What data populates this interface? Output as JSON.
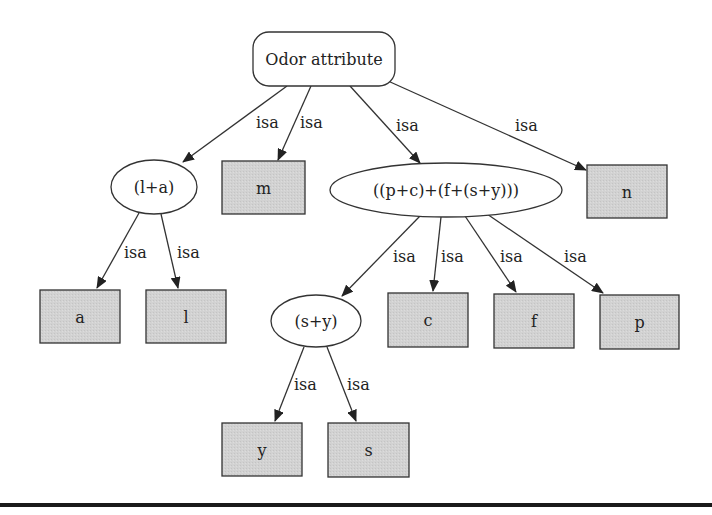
{
  "diagram": {
    "type": "tree",
    "colors": {
      "leaf_fill": "#d0d0d0",
      "stroke": "#333333",
      "background": "#ffffff",
      "rule": "#1a1a1a"
    },
    "nodes": [
      {
        "id": "root",
        "label": "Odor attribute",
        "shape": "rounded-rect",
        "x": 253,
        "y": 32,
        "w": 142,
        "h": 54
      },
      {
        "id": "la",
        "label": "(l+a)",
        "shape": "ellipse",
        "cx": 154,
        "cy": 187,
        "rx": 43,
        "ry": 27
      },
      {
        "id": "m",
        "label": "m",
        "shape": "box",
        "x": 222,
        "y": 161,
        "w": 83,
        "h": 53
      },
      {
        "id": "pcfsy",
        "label": "((p+c)+(f+(s+y)))",
        "shape": "ellipse",
        "cx": 446,
        "cy": 190,
        "rx": 116,
        "ry": 27
      },
      {
        "id": "n",
        "label": "n",
        "shape": "box",
        "x": 587,
        "y": 165,
        "w": 80,
        "h": 53
      },
      {
        "id": "a",
        "label": "a",
        "shape": "box",
        "x": 40,
        "y": 290,
        "w": 80,
        "h": 53
      },
      {
        "id": "l",
        "label": "l",
        "shape": "box",
        "x": 146,
        "y": 290,
        "w": 80,
        "h": 53
      },
      {
        "id": "sy",
        "label": "(s+y)",
        "shape": "ellipse",
        "cx": 316,
        "cy": 321,
        "rx": 45,
        "ry": 26
      },
      {
        "id": "c",
        "label": "c",
        "shape": "box",
        "x": 388,
        "y": 293,
        "w": 80,
        "h": 54
      },
      {
        "id": "f",
        "label": "f",
        "shape": "box",
        "x": 494,
        "y": 294,
        "w": 80,
        "h": 54
      },
      {
        "id": "p",
        "label": "p",
        "shape": "box",
        "x": 600,
        "y": 295,
        "w": 79,
        "h": 54
      },
      {
        "id": "y",
        "label": "y",
        "shape": "box",
        "x": 222,
        "y": 423,
        "w": 80,
        "h": 53
      },
      {
        "id": "s",
        "label": "s",
        "shape": "box",
        "x": 328,
        "y": 423,
        "w": 81,
        "h": 54
      }
    ],
    "edges": [
      {
        "from": "root",
        "to": "la",
        "label": "isa",
        "x1": 287,
        "y1": 86,
        "x2": 183,
        "y2": 162,
        "lx": 256,
        "ly": 128
      },
      {
        "from": "root",
        "to": "m",
        "label": "isa",
        "x1": 311,
        "y1": 86,
        "x2": 278,
        "y2": 160,
        "lx": 300,
        "ly": 128
      },
      {
        "from": "root",
        "to": "pcfsy",
        "label": "isa",
        "x1": 350,
        "y1": 86,
        "x2": 420,
        "y2": 163,
        "lx": 396,
        "ly": 131
      },
      {
        "from": "root",
        "to": "n",
        "label": "isa",
        "x1": 388,
        "y1": 81,
        "x2": 586,
        "y2": 170,
        "lx": 515,
        "ly": 131
      },
      {
        "from": "la",
        "to": "a",
        "label": "isa",
        "x1": 139,
        "y1": 213,
        "x2": 97,
        "y2": 288,
        "lx": 124,
        "ly": 258
      },
      {
        "from": "la",
        "to": "l",
        "label": "isa",
        "x1": 161,
        "y1": 214,
        "x2": 178,
        "y2": 288,
        "lx": 177,
        "ly": 258
      },
      {
        "from": "pcfsy",
        "to": "sy",
        "label": "isa",
        "x1": 420,
        "y1": 216,
        "x2": 342,
        "y2": 296,
        "lx": 393,
        "ly": 262
      },
      {
        "from": "pcfsy",
        "to": "c",
        "label": "isa",
        "x1": 441,
        "y1": 217,
        "x2": 433,
        "y2": 291,
        "lx": 441,
        "ly": 262
      },
      {
        "from": "pcfsy",
        "to": "f",
        "label": "isa",
        "x1": 465,
        "y1": 216,
        "x2": 516,
        "y2": 292,
        "lx": 500,
        "ly": 262
      },
      {
        "from": "pcfsy",
        "to": "p",
        "label": "isa",
        "x1": 487,
        "y1": 214,
        "x2": 603,
        "y2": 293,
        "lx": 564,
        "ly": 262
      },
      {
        "from": "sy",
        "to": "y",
        "label": "isa",
        "x1": 304,
        "y1": 347,
        "x2": 275,
        "y2": 421,
        "lx": 294,
        "ly": 390
      },
      {
        "from": "sy",
        "to": "s",
        "label": "isa",
        "x1": 327,
        "y1": 347,
        "x2": 356,
        "y2": 421,
        "lx": 347,
        "ly": 390
      }
    ]
  }
}
